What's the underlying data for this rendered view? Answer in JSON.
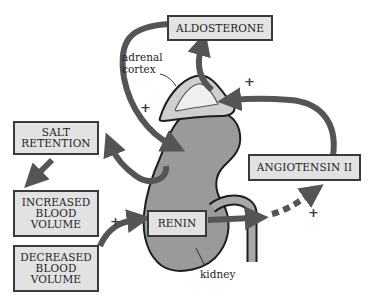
{
  "diagram": {
    "boxes": {
      "aldosterone": "ALDOSTERONE",
      "salt_retention": "SALT\nRETENTION",
      "increased_blood_volume": "INCREASED\nBLOOD\nVOLUME",
      "decreased_blood_volume": "DECREASED\nBLOOD\nVOLUME",
      "renin": "RENIN",
      "angiotensin_ii": "ANGIOTENSIN II"
    },
    "labels": {
      "adrenal_cortex": "adrenal\ncortex",
      "kidney": "kidney"
    },
    "signs": {
      "plus_adrenal_left": "+",
      "plus_adrenal_right": "+",
      "plus_decreased_to_renin": "+",
      "plus_angiotensin": "+"
    },
    "colors": {
      "arrow": "#555555",
      "kidney_fill": "#9a9a9a",
      "adrenal_outer": "#cfcfcf",
      "adrenal_inner": "#efefef",
      "box_fill": "#e2e2e2",
      "outline": "#1e1e1e"
    }
  }
}
